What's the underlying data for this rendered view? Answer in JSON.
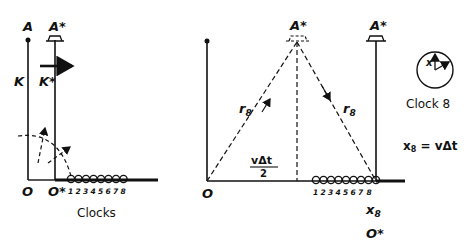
{
  "left_panel": {
    "label_A": "A",
    "label_A_star": "A*",
    "label_K": "K",
    "label_K_star": "K*",
    "label_O": "O",
    "label_O_star": "O*",
    "clock_numbers": [
      "1",
      "2",
      "3",
      "4",
      "5",
      "6",
      "7",
      "8"
    ],
    "caption": "Clocks"
  },
  "middle_panel": {
    "label_A_star_mid": "A*",
    "label_A_star_right": "A*",
    "label_r8_left": "r",
    "label_r8_left_sub": "8",
    "label_r8_right": "r",
    "label_r8_right_sub": "8",
    "fraction_numerator": "vΔt",
    "fraction_denominator": "2",
    "label_O": "O",
    "clock_numbers": [
      "1",
      "2",
      "3",
      "4",
      "5",
      "6",
      "7",
      "8"
    ],
    "label_x8": "x",
    "label_x8_sub": "8",
    "label_O_star": "O*"
  },
  "right_panel": {
    "clock_label": "Clock 8",
    "clock_hand_label": "x",
    "equation_lhs": "x",
    "equation_lhs_sub": "8",
    "equation_rhs": " = vΔt"
  }
}
